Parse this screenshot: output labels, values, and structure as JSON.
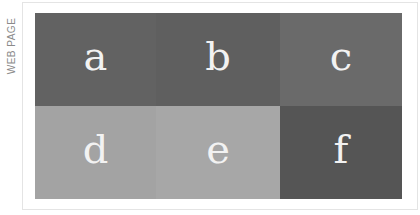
{
  "side_label": "WEB PAGE",
  "cells": [
    {
      "label": "a",
      "color": "#626262"
    },
    {
      "label": "b",
      "color": "#5f5f5f"
    },
    {
      "label": "c",
      "color": "#6a6a6a"
    },
    {
      "label": "d",
      "color": "#a3a3a3"
    },
    {
      "label": "e",
      "color": "#a7a7a7"
    },
    {
      "label": "f",
      "color": "#555555"
    }
  ]
}
